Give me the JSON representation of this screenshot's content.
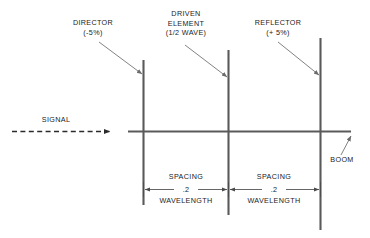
{
  "diagram": {
    "colors": {
      "element": "#5a5a5a",
      "boom": "#5a5a5a",
      "leader": "#6b6b6b",
      "dimension": "#4a4a4a",
      "signal": "#2b2b2b",
      "text": "#1a1a1a",
      "background": "#ffffff"
    },
    "signal": {
      "label": "SIGNAL"
    },
    "boom": {
      "label": "BOOM"
    },
    "elements": [
      {
        "name": "director",
        "label_lines": [
          "DIRECTOR",
          "(-5%)"
        ]
      },
      {
        "name": "driven-element",
        "label_lines": [
          "DRIVEN",
          "ELEMENT",
          "(1/2 WAVE)"
        ]
      },
      {
        "name": "reflector",
        "label_lines": [
          "REFLECTOR",
          "(+ 5%)"
        ]
      }
    ],
    "spacings": [
      {
        "name": "director-to-driven",
        "top_label": "SPACING",
        "value": ".2",
        "bottom_label": "WAVELENGTH"
      },
      {
        "name": "driven-to-reflector",
        "top_label": "SPACING",
        "value": ".2",
        "bottom_label": "WAVELENGTH"
      }
    ]
  }
}
